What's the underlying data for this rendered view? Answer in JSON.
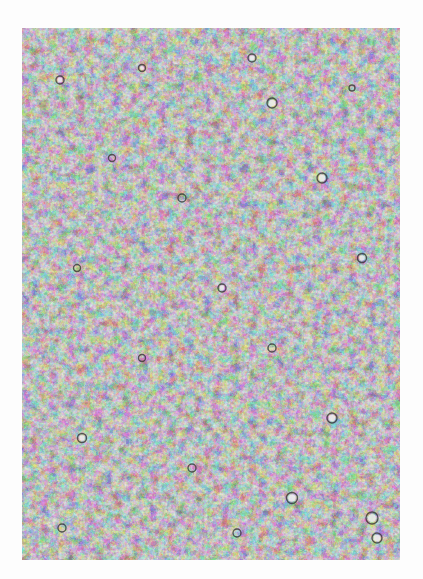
{
  "image": {
    "kind": "grayscale micrograph",
    "description": "dense mottled cellular/granular texture with light vesicles and dark interstitial network",
    "colors": {
      "background": "#fdfdfd",
      "light_phase": "#d8d8d8",
      "dark_phase": "#3a3a3a",
      "mid": "#9a9a9a"
    },
    "frame": {
      "x": 22,
      "y": 28,
      "width": 378,
      "height": 532
    }
  }
}
